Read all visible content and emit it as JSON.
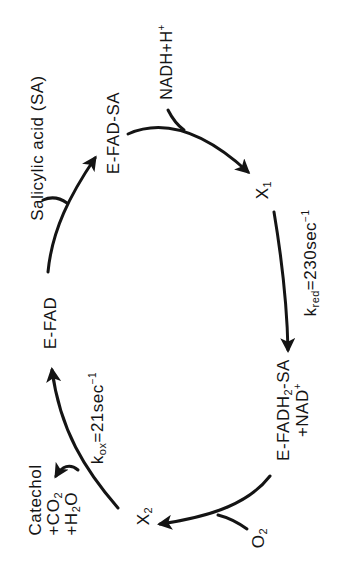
{
  "diagram": {
    "type": "catalytic-cycle",
    "orientation": "rotated-90-ccw",
    "colors": {
      "ink": "#141414",
      "background": "#ffffff"
    },
    "nodes": {
      "e_fad": {
        "label": "E-FAD"
      },
      "e_fad_sa": {
        "label": "E-FAD-SA"
      },
      "x1": {
        "label": "X",
        "sub": "1"
      },
      "e_fadh2_sa": {
        "label_pre": "E-FADH",
        "sub": "2",
        "label_post": "-SA",
        "coproduct": "+NAD",
        "coproduct_sup": "+"
      },
      "x2": {
        "label": "X",
        "sub": "2"
      }
    },
    "inputs": {
      "salicylic_acid": {
        "label": "Salicylic acid (SA)"
      },
      "nadh": {
        "label": "NADH+H",
        "sup": "+"
      },
      "o2": {
        "label": "O",
        "sub": "2"
      }
    },
    "outputs": {
      "products": {
        "line1": "Catechol",
        "line2_pre": "+CO",
        "line2_sub": "2",
        "line3_pre": "+H",
        "line3_sub": "2",
        "line3_post": "O"
      }
    },
    "rates": {
      "kred": {
        "k": "k",
        "sub": "red",
        "value": "=230sec",
        "sup": "−1"
      },
      "kox": {
        "k": "k",
        "sub": "ox",
        "value": "=21sec",
        "sup": "−1"
      }
    },
    "edges": [
      {
        "from": "E-FAD",
        "to": "E-FAD-SA",
        "input": "Salicylic acid (SA)"
      },
      {
        "from": "E-FAD-SA",
        "to": "X1",
        "input": "NADH+H+"
      },
      {
        "from": "X1",
        "to": "E-FADH2-SA",
        "rate": "kred=230sec-1",
        "output": "+NAD+"
      },
      {
        "from": "E-FADH2-SA",
        "to": "X2",
        "input": "O2"
      },
      {
        "from": "X2",
        "to": "E-FAD",
        "rate": "kox=21sec-1",
        "output": "Catechol +CO2 +H2O"
      }
    ]
  }
}
